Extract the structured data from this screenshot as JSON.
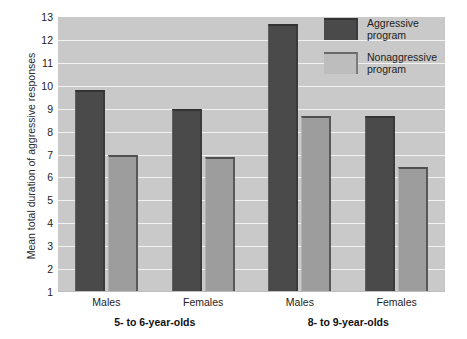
{
  "chart_data": {
    "type": "bar",
    "title": "",
    "xlabel": "",
    "ylabel": "Mean total duration of aggressive responses",
    "ylim": [
      1,
      13
    ],
    "yticks": [
      1,
      2,
      3,
      4,
      5,
      6,
      7,
      8,
      9,
      10,
      11,
      12,
      13
    ],
    "grid": true,
    "legend_position": "top-right",
    "categories": [
      "Males",
      "Females",
      "Males",
      "Females"
    ],
    "group_labels": [
      "5- to 6-year-olds",
      "8- to 9-year-olds"
    ],
    "series": [
      {
        "name": "Aggressive program",
        "color": "#4a4a4a",
        "values": [
          9.8,
          9.0,
          12.7,
          8.7
        ]
      },
      {
        "name": "Nonaggressive program",
        "color": "#9d9d9d",
        "values": [
          7.0,
          6.9,
          8.7,
          6.45
        ]
      }
    ]
  },
  "axis": {
    "y_title": "Mean total duration of aggressive responses",
    "y_tick_labels": [
      "13",
      "12",
      "11",
      "10",
      "9",
      "8",
      "7",
      "6",
      "5",
      "4",
      "3",
      "2",
      "1"
    ]
  },
  "legend": {
    "items": [
      {
        "line1": "Aggressive",
        "line2": "program",
        "swatch": "dark-swatch"
      },
      {
        "line1": "Nonaggressive",
        "line2": "program",
        "swatch": "light-swatch"
      }
    ]
  },
  "x_axis": {
    "tick_labels": [
      "Males",
      "Females",
      "Males",
      "Females"
    ],
    "group_labels": [
      "5- to 6-year-olds",
      "8- to 9-year-olds"
    ]
  },
  "colors": {
    "aggressive": "#4a4a4a",
    "nonaggressive": "#9d9d9d",
    "plot_background": "#c9c9c9",
    "gridline": "#f2f2f2",
    "page_background": "#ffffff"
  }
}
